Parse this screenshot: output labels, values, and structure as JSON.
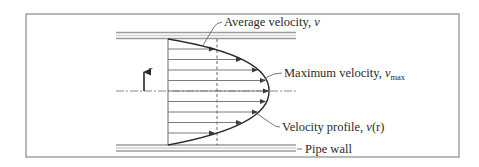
{
  "diagram": {
    "labels": {
      "average_velocity": {
        "text": "Average velocity, ",
        "symbol": "v"
      },
      "maximum_velocity": {
        "text": "Maximum velocity, ",
        "symbol": "v",
        "subscript": "max"
      },
      "velocity_profile": {
        "text": "Velocity profile, ",
        "symbol": "v",
        "suffix": "(r)"
      },
      "pipe_wall": {
        "text": "Pipe wall"
      },
      "radial_axis": {
        "symbol": "r"
      }
    },
    "colors": {
      "frame": "#8a8a8a",
      "pipe_wall": "#9a9a9a",
      "ink": "#2a2a2a",
      "arrow_line": "#7a7a7a"
    },
    "profile": {
      "shape": "parabolic",
      "arrow_count": 11
    }
  }
}
